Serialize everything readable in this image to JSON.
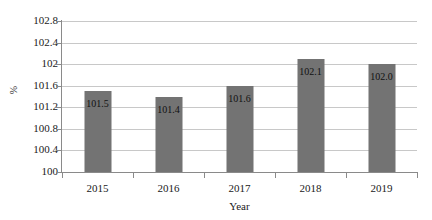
{
  "chart_data": {
    "type": "bar",
    "title": "",
    "subtitle": "",
    "xlabel": "Year",
    "ylabel": "%",
    "categories": [
      "2015",
      "2016",
      "2017",
      "2018",
      "2019"
    ],
    "values": [
      101.5,
      101.4,
      101.6,
      102.1,
      102.0
    ],
    "data_labels": [
      "101.5",
      "101.4",
      "101.6",
      "102.1",
      "102.0"
    ],
    "ylim": [
      100,
      102.8
    ],
    "ytick_labels": [
      "102.8",
      "102.4",
      "102",
      "101.6",
      "101.2",
      "100.8",
      "100.4",
      "100"
    ],
    "ytick_values": [
      102.8,
      102.4,
      102.0,
      101.6,
      101.2,
      100.8,
      100.4,
      100.0
    ],
    "grid": true,
    "legend": false,
    "legend_position": "none",
    "bar_color": "#737373",
    "gridline_color": "#c8c8c8",
    "axis_color": "#8a8a8a",
    "background_color": "#ffffff",
    "label_text_color": "#111111"
  }
}
